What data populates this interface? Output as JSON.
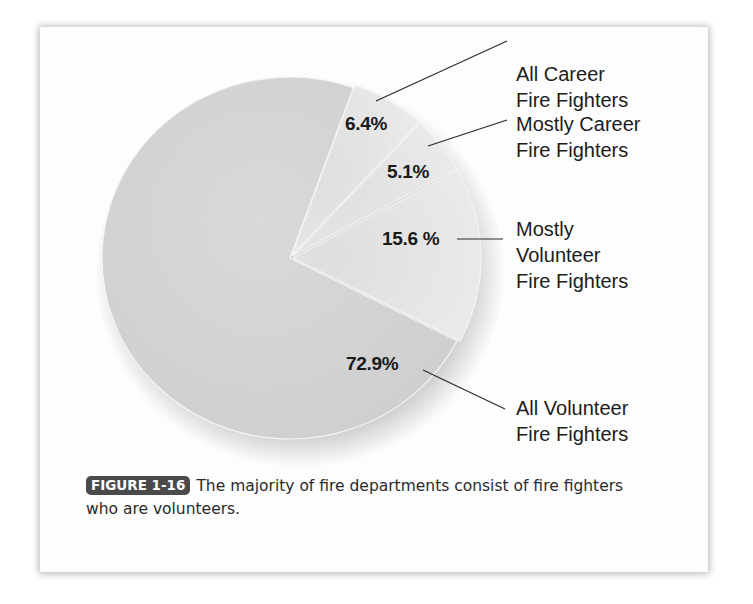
{
  "chart_data": {
    "type": "pie",
    "title": "",
    "categories": [
      "All Career Fire Fighters",
      "Mostly Career Fire Fighters",
      "Mostly Volunteer Fire Fighters",
      "All Volunteer Fire Fighters"
    ],
    "values": [
      6.4,
      5.1,
      15.6,
      72.9
    ],
    "value_labels": [
      "6.4%",
      "5.1%",
      "15.6 %",
      "72.9%"
    ],
    "unit": "%",
    "legend_position": "right (leader-line callouts)",
    "colors": {
      "large_slice": "#d3d3d3",
      "small_slices": "#e6e6e6",
      "slice_border": "#f4f4f4"
    }
  },
  "labels": {
    "all_career": [
      "All Career",
      "Fire Fighters"
    ],
    "mostly_career": [
      "Mostly Career",
      "Fire Fighters"
    ],
    "mostly_volunteer": [
      "Mostly",
      "Volunteer",
      "Fire Fighters"
    ],
    "all_volunteer": [
      "All Volunteer",
      "Fire Fighters"
    ]
  },
  "caption": {
    "badge": "FIGURE 1-16",
    "text": "The majority of fire departments consist of fire fighters who are volunteers."
  }
}
